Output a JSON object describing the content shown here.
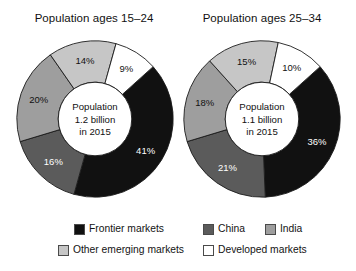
{
  "chart_data": [
    {
      "type": "pie",
      "title": "Population ages 15–24",
      "center_label": [
        "Population",
        "1.2 billion",
        "in 2015"
      ],
      "categories": [
        "Frontier markets",
        "China",
        "India",
        "Other emerging markets",
        "Developed markets"
      ],
      "values": [
        41,
        16,
        20,
        14,
        9
      ],
      "value_labels": [
        "41%",
        "16%",
        "20%",
        "14%",
        "9%"
      ],
      "colors": [
        "#111111",
        "#5b5b5b",
        "#9e9e9e",
        "#c6c6c6",
        "#ffffff"
      ],
      "label_text_colors": [
        "#ffffff",
        "#ffffff",
        "#111111",
        "#111111",
        "#111111"
      ],
      "donut_hole_ratio": 0.47,
      "start_angle_deg": -42,
      "legend_position": "bottom",
      "grid": false,
      "xlabel": "",
      "ylabel": ""
    },
    {
      "type": "pie",
      "title": "Population ages 25–34",
      "center_label": [
        "Population",
        "1.1 billion",
        "in 2015"
      ],
      "categories": [
        "Frontier markets",
        "China",
        "India",
        "Other emerging markets",
        "Developed markets"
      ],
      "values": [
        36,
        21,
        18,
        15,
        10
      ],
      "value_labels": [
        "36%",
        "21%",
        "18%",
        "15%",
        "10%"
      ],
      "colors": [
        "#111111",
        "#5b5b5b",
        "#9e9e9e",
        "#c6c6c6",
        "#ffffff"
      ],
      "label_text_colors": [
        "#ffffff",
        "#ffffff",
        "#111111",
        "#111111",
        "#111111"
      ],
      "donut_hole_ratio": 0.47,
      "start_angle_deg": -42,
      "legend_position": "bottom",
      "grid": false,
      "xlabel": "",
      "ylabel": ""
    }
  ],
  "charts": [
    {
      "title": "Population ages 15–24"
    },
    {
      "title": "Population ages 25–34"
    }
  ],
  "legend": {
    "items": [
      {
        "key": "frontier",
        "label": "Frontier markets",
        "color": "#111111"
      },
      {
        "key": "china",
        "label": "China",
        "color": "#5b5b5b"
      },
      {
        "key": "india",
        "label": "India",
        "color": "#9e9e9e"
      },
      {
        "key": "other",
        "label": "Other emerging markets",
        "color": "#c6c6c6"
      },
      {
        "key": "developed",
        "label": "Developed markets",
        "color": "#ffffff"
      }
    ]
  }
}
